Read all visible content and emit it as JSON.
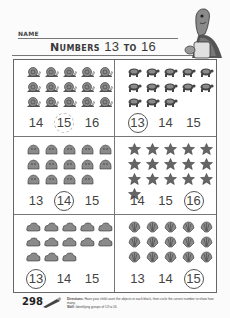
{
  "header": {
    "name_label": "NAME",
    "title_word1": "Numbers",
    "title_num1": "13",
    "title_word2": "to",
    "title_num2": "16"
  },
  "panels": [
    {
      "object": "snail",
      "count": 15,
      "rows": [
        5,
        5,
        5
      ],
      "choices": [
        "14",
        "15",
        "16"
      ],
      "circled_index": 1,
      "circle_style": "example-dashed"
    },
    {
      "object": "turtle",
      "count": 13,
      "rows": [
        5,
        5,
        3
      ],
      "choices": [
        "13",
        "14",
        "15"
      ],
      "circled_index": 0,
      "circle_style": "solid"
    },
    {
      "object": "rock",
      "count": 14,
      "rows": [
        5,
        5,
        4
      ],
      "choices": [
        "13",
        "14",
        "15"
      ],
      "circled_index": 1,
      "circle_style": "solid"
    },
    {
      "object": "starfish",
      "count": 16,
      "rows": [
        5,
        5,
        5,
        1
      ],
      "choices": [
        "14",
        "15",
        "16"
      ],
      "circled_index": 2,
      "circle_style": "solid"
    },
    {
      "object": "cloud",
      "count": 13,
      "rows": [
        5,
        5,
        3
      ],
      "choices": [
        "13",
        "14",
        "15"
      ],
      "circled_index": 0,
      "circle_style": "solid"
    },
    {
      "object": "shell",
      "count": 15,
      "rows": [
        5,
        5,
        5
      ],
      "choices": [
        "13",
        "14",
        "15"
      ],
      "circled_index": 2,
      "circle_style": "solid"
    }
  ],
  "footer": {
    "page_number": "298",
    "directions_label": "Directions:",
    "directions_text": "Have your child count the objects in each block, then circle the correct number to show how many.",
    "skill_label": "Skill:",
    "skill_text": "Identifying groups of 13 to 16."
  },
  "colors": {
    "ink": "#333333",
    "object_fill": "#8a8a8a",
    "rule": "#777777",
    "paper": "#fbfbfb"
  }
}
